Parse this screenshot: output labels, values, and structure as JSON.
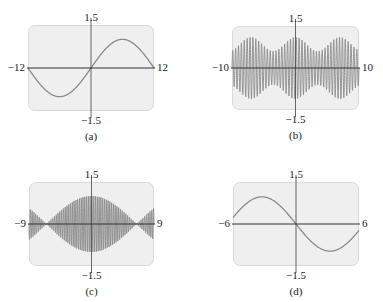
{
  "chart_data": [
    {
      "id": "a",
      "type": "line",
      "caption": "(a)",
      "xlim": [
        -12,
        12
      ],
      "ylim": [
        -1.5,
        1.5
      ],
      "tick_labels": {
        "left": "−12",
        "right": "12",
        "top": "1.5",
        "bottom": "−1.5"
      },
      "description": "single smooth sine wave, amplitude ~1, period ~24; min near x=-6, max near x=6",
      "function": {
        "kind": "sine",
        "amplitude": 1.0,
        "frequency": 0.2618,
        "envelope": "none"
      },
      "grid": false,
      "box": {
        "left": 28,
        "top": 25,
        "width": 126,
        "height": 86
      },
      "curve_color": "#8a8a8a"
    },
    {
      "id": "b",
      "type": "line",
      "caption": "(b)",
      "xlim": [
        -10,
        10
      ],
      "ylim": [
        -1.5,
        1.5
      ],
      "tick_labels": {
        "left": "−10",
        "right": "10",
        "top": "1.5",
        "bottom": "−1.5"
      },
      "description": "rapid oscillation (~44 cycles) with slowly varying envelope between ~0.6 and ~1.1",
      "function": {
        "kind": "modulated",
        "carrier_cycles": 44,
        "envelope_base": 0.85,
        "envelope_amp": 0.25,
        "envelope_period": 7.0
      },
      "grid": false,
      "box": {
        "left": 232,
        "top": 26,
        "width": 127,
        "height": 84
      },
      "curve_color": "#8a8a8a"
    },
    {
      "id": "c",
      "type": "line",
      "caption": "(c)",
      "xlim": [
        -9,
        9
      ],
      "ylim": [
        -1.5,
        1.5
      ],
      "tick_labels": {
        "left": "−9",
        "right": "9",
        "top": "1.5",
        "bottom": "−1.5"
      },
      "description": "rapid oscillation (~70 cycles) with beat envelope |cos|, max ~1 at x=0, nodes near x=±6.5",
      "function": {
        "kind": "beat",
        "carrier_cycles": 70,
        "envelope_amp": 1.0,
        "envelope_half_period": 13.0
      },
      "grid": false,
      "box": {
        "left": 29,
        "top": 182,
        "width": 125,
        "height": 84
      },
      "curve_color": "#8a8a8a"
    },
    {
      "id": "d",
      "type": "line",
      "caption": "(d)",
      "xlim": [
        -6,
        6
      ],
      "ylim": [
        -1.5,
        1.5
      ],
      "tick_labels": {
        "left": "−6",
        "right": "6",
        "top": "1.5",
        "bottom": "−1.5"
      },
      "description": "smooth decreasing curve through origin, ~0.95 at x=-6 to ~-0.95 at x=6",
      "function": {
        "kind": "neg_sine",
        "amplitude": 1.0,
        "frequency": 0.2618,
        "envelope": "none"
      },
      "grid": false,
      "box": {
        "left": 233,
        "top": 182,
        "width": 126,
        "height": 84
      },
      "curve_color": "#8a8a8a"
    }
  ]
}
